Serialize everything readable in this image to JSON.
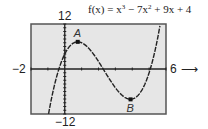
{
  "chart_data": {
    "type": "line",
    "function": "x^3 - 7x^2 + 9x + 4",
    "xlim": [
      -2,
      6
    ],
    "ylim": [
      -12,
      12
    ],
    "xscale": 1,
    "yscale": 1,
    "tick_labels": {
      "x_min": "−2",
      "x_max": "6",
      "y_max": "12",
      "y_min": "−12"
    },
    "arrow": "⟶",
    "grid": false,
    "points": [
      {
        "label": "A",
        "x": 0.77,
        "y": 7.24,
        "type": "relative maximum"
      },
      {
        "label": "B",
        "x": 3.9,
        "y": -8.1,
        "type": "relative minimum"
      }
    ],
    "colors": {
      "background": "#e6e6e6",
      "frame": "#555555",
      "curve": "#222222",
      "axis": "#222222"
    }
  }
}
